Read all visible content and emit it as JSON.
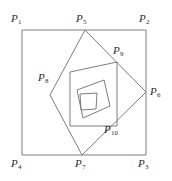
{
  "figure": {
    "background_color": "#ffffff",
    "stroke_color": "#7d7d7d",
    "label_color": "#2b2b2b",
    "stroke_width": 1,
    "width": 172,
    "height": 181
  },
  "labels": [
    {
      "id": "P1",
      "base": "P",
      "sub": "1",
      "x": 11,
      "y": 13
    },
    {
      "id": "P2",
      "base": "P",
      "sub": "2",
      "x": 139,
      "y": 13
    },
    {
      "id": "P3",
      "base": "P",
      "sub": "3",
      "x": 138,
      "y": 158
    },
    {
      "id": "P4",
      "base": "P",
      "sub": "4",
      "x": 11,
      "y": 158
    },
    {
      "id": "P5",
      "base": "P",
      "sub": "5",
      "x": 76,
      "y": 13
    },
    {
      "id": "P6",
      "base": "P",
      "sub": "6",
      "x": 150,
      "y": 86
    },
    {
      "id": "P7",
      "base": "P",
      "sub": "7",
      "x": 75,
      "y": 158
    },
    {
      "id": "P8",
      "base": "P",
      "sub": "8",
      "x": 38,
      "y": 72
    },
    {
      "id": "P9",
      "base": "P",
      "sub": "9",
      "x": 113,
      "y": 45
    },
    {
      "id": "P10",
      "base": "P",
      "sub": "10",
      "x": 104,
      "y": 124
    }
  ],
  "chart_data": {
    "type": "diagram",
    "polygons": [
      {
        "name": "outer-square",
        "vertices": [
          [
            22,
            30
          ],
          [
            146,
            30
          ],
          [
            146,
            155
          ],
          [
            22,
            155
          ]
        ],
        "labeled_vertices": [
          "P1",
          "P2",
          "P3",
          "P4"
        ]
      },
      {
        "name": "second-square",
        "vertices": [
          [
            85,
            30
          ],
          [
            146,
            92
          ],
          [
            82,
            155
          ],
          [
            50,
            95
          ]
        ],
        "labeled_vertices": [
          "P5",
          "P6",
          "P7",
          "P8"
        ]
      },
      {
        "name": "third-square",
        "vertices": [
          [
            117,
            62
          ],
          [
            117,
            126
          ],
          [
            70,
            126
          ],
          [
            70,
            72
          ]
        ],
        "labeled_vertices": [
          "P9",
          "P10"
        ]
      },
      {
        "name": "fourth-square",
        "vertices": [
          [
            104,
            80
          ],
          [
            110,
            106
          ],
          [
            83,
            118
          ],
          [
            77,
            90
          ]
        ],
        "labeled_vertices": []
      },
      {
        "name": "fifth-square",
        "vertices": [
          [
            97,
            93
          ],
          [
            96,
            109
          ],
          [
            81,
            110
          ],
          [
            80,
            94
          ]
        ],
        "labeled_vertices": []
      }
    ]
  }
}
